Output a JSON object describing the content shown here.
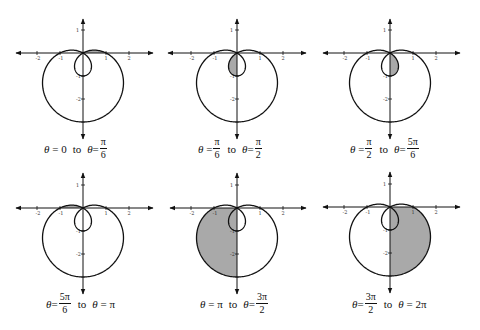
{
  "figure": {
    "equation": "r = 1 - 2 sin(theta)",
    "shade_color": "#a9a9a9",
    "scale_px_per_unit": 23,
    "panels": [
      {
        "id": "p1",
        "origin": [
          83,
          53
        ],
        "x_axis": [
          16,
          153
        ],
        "y_axis": [
          19,
          139
        ],
        "theta_start": 0,
        "theta_end": 0.5235988,
        "caption": {
          "left": {
            "lhs": "θ",
            "eq": "=",
            "value": "0"
          },
          "to": "to",
          "right": {
            "lhs": "θ",
            "eq": "=",
            "num": "π",
            "den": "6"
          }
        },
        "caption_pos": [
          44,
          137
        ]
      },
      {
        "id": "p2",
        "origin": [
          237,
          53
        ],
        "x_axis": [
          168,
          306
        ],
        "y_axis": [
          19,
          139
        ],
        "theta_start": 0.5235988,
        "theta_end": 1.5707963,
        "caption": {
          "left": {
            "lhs": "θ",
            "eq": "=",
            "num": "π",
            "den": "6"
          },
          "to": "to",
          "right": {
            "lhs": "θ",
            "eq": "=",
            "num": "π",
            "den": "2"
          }
        },
        "caption_pos": [
          198,
          137
        ]
      },
      {
        "id": "p3",
        "origin": [
          390,
          53
        ],
        "x_axis": [
          323,
          460
        ],
        "y_axis": [
          19,
          139
        ],
        "theta_start": 1.5707963,
        "theta_end": 2.6179939,
        "caption": {
          "left": {
            "lhs": "θ",
            "eq": "=",
            "num": "π",
            "den": "2"
          },
          "to": "to",
          "right": {
            "lhs": "θ",
            "eq": "=",
            "num": "5π",
            "den": "6"
          }
        },
        "caption_pos": [
          350,
          137
        ]
      },
      {
        "id": "p4",
        "origin": [
          83,
          208
        ],
        "x_axis": [
          16,
          153
        ],
        "y_axis": [
          173,
          294
        ],
        "theta_start": 2.6179939,
        "theta_end": 3.1415927,
        "caption": {
          "left": {
            "lhs": "θ",
            "eq": "=",
            "num": "5π",
            "den": "6"
          },
          "to": "to",
          "right": {
            "lhs": "θ",
            "eq": "=",
            "value": "π"
          }
        },
        "caption_pos": [
          46,
          292
        ]
      },
      {
        "id": "p5",
        "origin": [
          237,
          208
        ],
        "x_axis": [
          170,
          306
        ],
        "y_axis": [
          173,
          294
        ],
        "theta_start": 3.1415927,
        "theta_end": 4.712389,
        "caption": {
          "left": {
            "lhs": "θ",
            "eq": "=",
            "value": "π"
          },
          "to": "to",
          "right": {
            "lhs": "θ",
            "eq": "=",
            "num": "3π",
            "den": "2"
          }
        },
        "caption_pos": [
          200,
          292
        ]
      },
      {
        "id": "p6",
        "origin": [
          390,
          207
        ],
        "x_axis": [
          323,
          460
        ],
        "y_axis": [
          172,
          293
        ],
        "theta_start": 4.712389,
        "theta_end": 6.2831853,
        "caption": {
          "left": {
            "lhs": "θ",
            "eq": "=",
            "num": "3π",
            "den": "2"
          },
          "to": "to",
          "right": {
            "lhs": "θ",
            "eq": "=",
            "value": "2π"
          }
        },
        "caption_pos": [
          352,
          292
        ]
      }
    ],
    "tick_labels": {
      "x": [
        "-2",
        "-1",
        "1",
        "2"
      ],
      "y": [
        "1",
        "-1",
        "-2"
      ]
    }
  }
}
